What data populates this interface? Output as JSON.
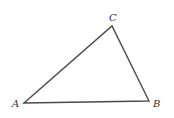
{
  "diagram": {
    "type": "triangle",
    "stroke_color": "#4a4a4a",
    "vertices": [
      {
        "label": "A",
        "x": 24,
        "y": 103,
        "label_x": 12,
        "label_y": 107
      },
      {
        "label": "B",
        "x": 149,
        "y": 101,
        "label_x": 153,
        "label_y": 107
      },
      {
        "label": "C",
        "x": 112,
        "y": 26,
        "label_x": 109,
        "label_y": 21
      }
    ]
  }
}
